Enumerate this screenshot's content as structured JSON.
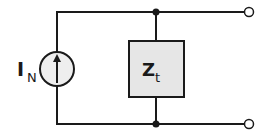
{
  "diagram": {
    "type": "Norton equivalent circuit",
    "source": {
      "label_main": "I",
      "label_sub": "N",
      "kind": "current source",
      "arrow_direction": "up"
    },
    "impedance": {
      "label_main": "Z",
      "label_sub": "t",
      "fill": "#e6e6e6"
    },
    "terminals": 2,
    "colors": {
      "wire": "#1a1a1a",
      "box_fill": "#e6e6e6",
      "source_fill": "#eeeeee"
    }
  }
}
